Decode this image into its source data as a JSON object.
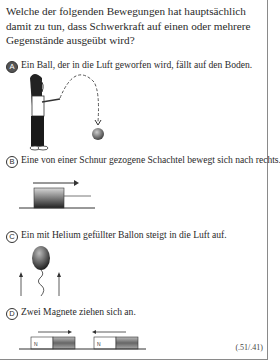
{
  "question": {
    "text": "Welche der folgenden Bewegungen hat hauptsächlich damit zu tun, dass Schwerkraft auf einen oder mehrere Gegenstände ausgeübt wird?"
  },
  "options": [
    {
      "letter": "A",
      "text": "Ein Ball, der in die Luft geworfen wird, fällt auf den Boden.",
      "selected": true,
      "figure": "girl-throwing-ball"
    },
    {
      "letter": "B",
      "text": "Eine von einer Schnur gezogene Schachtel bewegt sich nach rechts.",
      "selected": false,
      "figure": "box-pulled-right"
    },
    {
      "letter": "C",
      "text": "Ein mit Helium gefüllter Ballon steigt in die Luft auf.",
      "selected": false,
      "figure": "balloon-rising"
    },
    {
      "letter": "D",
      "text": "Zwei Magnete ziehen sich an.",
      "selected": false,
      "figure": "magnets-attracting",
      "magnet_label": "N"
    }
  ],
  "footer": {
    "code": "(.51/.41)",
    "item_id": "S061048"
  }
}
